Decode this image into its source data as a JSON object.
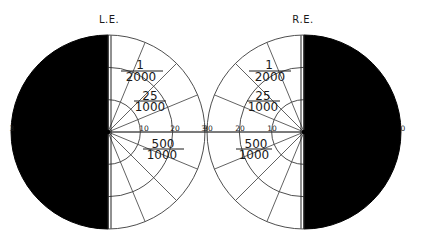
{
  "figure": {
    "type": "visual-field-perimetry",
    "colors": {
      "background": "#ffffff",
      "line": "#3a3a3a",
      "blind_field": "#000000",
      "text": "#1a1a1a"
    }
  },
  "eyes": [
    {
      "id": "left",
      "label": "L.E.",
      "blind_half": "left",
      "ring_degrees": [
        10,
        20,
        30
      ],
      "axis_labels": [
        "10",
        "20",
        "30"
      ],
      "edge_label": "3",
      "isopters": [
        {
          "numerator": "1",
          "denominator": "2000",
          "position": "upper-outer"
        },
        {
          "numerator": "25",
          "denominator": "1000",
          "position": "upper-middle"
        },
        {
          "numerator": "500",
          "denominator": "1000",
          "position": "lower-middle"
        }
      ]
    },
    {
      "id": "right",
      "label": "R.E.",
      "blind_half": "right",
      "ring_degrees": [
        10,
        20,
        30
      ],
      "axis_labels": [
        "10",
        "20",
        "30"
      ],
      "edge_label": "0",
      "isopters": [
        {
          "numerator": "1",
          "denominator": "2000",
          "position": "upper-outer"
        },
        {
          "numerator": "25",
          "denominator": "1000",
          "position": "upper-middle"
        },
        {
          "numerator": "500",
          "denominator": "1000",
          "position": "lower-middle"
        }
      ]
    }
  ]
}
